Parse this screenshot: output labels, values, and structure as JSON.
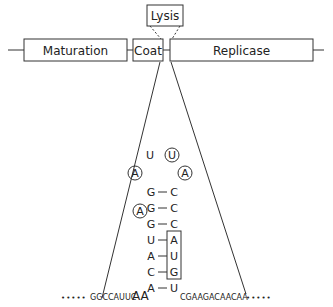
{
  "genome": {
    "genes": [
      {
        "name": "Maturation"
      },
      {
        "name": "Coat"
      },
      {
        "name": "Replicase"
      }
    ],
    "overlap_gene": {
      "name": "Lysis"
    }
  },
  "hairpin": {
    "loop": {
      "top_left": "U",
      "top_right": "U",
      "left": "A",
      "right": "A",
      "bulge": "A"
    },
    "pairs": [
      {
        "left": "G",
        "right": "C",
        "boxed": false
      },
      {
        "left": "G",
        "right": "C",
        "boxed": false
      },
      {
        "left": "G",
        "right": "C",
        "boxed": false
      },
      {
        "left": "U",
        "right": "A",
        "boxed": true
      },
      {
        "left": "A",
        "right": "U",
        "boxed": true
      },
      {
        "left": "C",
        "right": "G",
        "boxed": true
      },
      {
        "left": "A",
        "right": "U",
        "boxed": false
      }
    ],
    "dash": "—",
    "five_prime": {
      "dots": "•••••",
      "seq": "GGCCAUUC",
      "big": "AA"
    },
    "three_prime": {
      "seq": "CGAAGACAACAA",
      "dots": "•••••"
    }
  }
}
